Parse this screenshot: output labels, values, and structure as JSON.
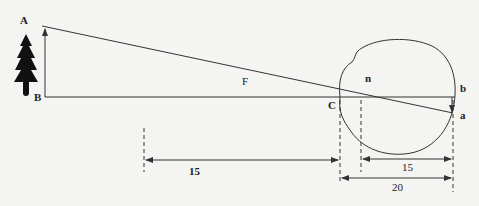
{
  "diagram": {
    "colors": {
      "background": "#f4f4f2",
      "ink": "#333333"
    },
    "labels": {
      "A": "A",
      "B": "B",
      "F": "F",
      "C": "C",
      "n": "n",
      "b": "b",
      "a": "a"
    },
    "dimensions": {
      "object_to_cornea": "15",
      "nodal_to_retina": "15",
      "cornea_to_retina": "20"
    },
    "icons": {
      "object": "tree-icon"
    }
  }
}
